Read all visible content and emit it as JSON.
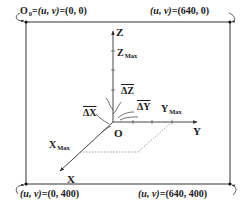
{
  "corners": {
    "top_left": {
      "prefix": "O",
      "prefix_sub": "0",
      "eq": "=",
      "uv": "(u, v)",
      "value": "(0, 0)"
    },
    "top_right": {
      "uv": "(u, v)",
      "eq": "=",
      "value": "(640, 0)"
    },
    "bottom_left": {
      "uv": "(u, v)",
      "eq": "=",
      "value": "(0, 400)"
    },
    "bottom_right": {
      "uv": "(u, v)",
      "eq": "=",
      "value": "(640, 400)"
    }
  },
  "axes": {
    "origin": "O",
    "x": {
      "label": "X",
      "max_label": "X",
      "max_sub": "Max",
      "delta": "ΔX"
    },
    "y": {
      "label": "Y",
      "max_label": "Y",
      "max_sub": "Max",
      "delta": "ΔY"
    },
    "z": {
      "label": "Z",
      "max_label": "Z",
      "max_sub": "Max",
      "delta": "ΔZ"
    }
  },
  "colors": {
    "line": "#333333",
    "dashed": "#777777",
    "frame": "#555555"
  }
}
